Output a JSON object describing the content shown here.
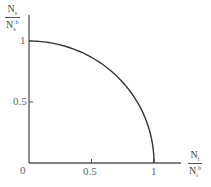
{
  "chart_data": {
    "type": "line",
    "title": "",
    "xlabel": "N_t / N_t^b",
    "ylabel": "N_s / N_s^b",
    "xlim": [
      0,
      1.2
    ],
    "ylim": [
      0,
      1.2
    ],
    "grid": false,
    "legend": null,
    "x_ticks": [
      "0",
      "0.5",
      "1"
    ],
    "y_ticks": [
      "0.5",
      "1"
    ],
    "series": [
      {
        "name": "boundary",
        "x": [
          0,
          0.1,
          0.2,
          0.3,
          0.4,
          0.5,
          0.6,
          0.7,
          0.8,
          0.9,
          0.95,
          1.0
        ],
        "y": [
          1.0,
          0.995,
          0.98,
          0.954,
          0.917,
          0.866,
          0.8,
          0.714,
          0.6,
          0.436,
          0.312,
          0.0
        ]
      }
    ]
  },
  "labels": {
    "y_num": "N",
    "y_num_sub": "s",
    "y_den": "N",
    "y_den_sub": "s",
    "y_den_sup": "b",
    "x_num": "N",
    "x_num_sub": "t",
    "x_den": "N",
    "x_den_sub": "t",
    "x_den_sup": "b",
    "origin": "0",
    "x_tick_half": "0.5",
    "x_tick_one": "1",
    "y_tick_half": "0.5",
    "y_tick_one": "1"
  }
}
